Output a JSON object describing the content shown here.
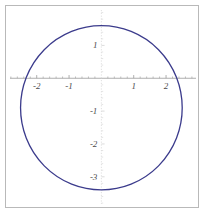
{
  "figure": {
    "title": "",
    "frame": true,
    "background": "#ffffff",
    "frame_color": "#b9b9b9",
    "curve_color": "#3b3b8c",
    "axis_color": "#9a9a9a",
    "gridline_color": "#d8d8d8",
    "tick_label_color": "#4a4a4a"
  },
  "axes": {
    "x_axis_label": "",
    "y_axis_label": "",
    "xlim": [
      -2.95,
      3.05
    ],
    "ylim": [
      -3.95,
      2.2
    ],
    "x_ticks": [
      -2,
      -1,
      1,
      2
    ],
    "x_tick_labels": [
      "-2",
      "-1",
      "1",
      "2"
    ],
    "y_ticks": [
      1,
      -1,
      -2,
      -3
    ],
    "y_tick_labels": [
      "1",
      "-1",
      "-2",
      "-3"
    ],
    "x_minor_step": 0.2,
    "y_minor_step": 0.2,
    "origin": [
      0,
      0
    ],
    "grid": false
  },
  "chart_data": {
    "type": "line",
    "title": "",
    "xlabel": "",
    "ylabel": "",
    "xlim": [
      -2.95,
      3.05
    ],
    "ylim": [
      -3.95,
      2.2
    ],
    "grid": false,
    "legend": null,
    "series": [
      {
        "name": "circle",
        "shape": "circle",
        "center": [
          0.0,
          -0.9
        ],
        "radius": 2.5,
        "color": "#3b3b8c",
        "linewidth": 1.3,
        "equation": "x^2 + (y + 0.9)^2 = 2.5^2",
        "extent_x": [
          -2.5,
          2.5
        ],
        "extent_y": [
          -3.4,
          1.6
        ]
      }
    ],
    "x_tick_labels": [
      "-2",
      "-1",
      "1",
      "2"
    ],
    "y_tick_labels": [
      "1",
      "-1",
      "-2",
      "-3"
    ],
    "x_ticks": [
      -2,
      -1,
      1,
      2
    ],
    "y_ticks": [
      1,
      -1,
      -2,
      -3
    ]
  }
}
